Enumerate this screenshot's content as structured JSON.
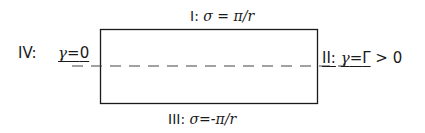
{
  "diagram": {
    "type": "boundary-conditions",
    "shape": "rectangle",
    "centerline": "dashed",
    "boundaries": {
      "top": {
        "id": "I",
        "prefix": "I:",
        "text": "σ = π/r"
      },
      "right": {
        "id": "II",
        "prefix": "II:",
        "var": "γ",
        "eq": "=",
        "val": "Γ",
        "rest": " > 0"
      },
      "bottom": {
        "id": "III",
        "prefix": "III:",
        "text": "σ=-π/r"
      },
      "left": {
        "id": "IV",
        "prefix": "IV:",
        "var": "γ",
        "eq": "=",
        "val": "0"
      }
    },
    "colors": {
      "line": "#1a1a1a",
      "dash": "#444444",
      "background": "#ffffff"
    }
  }
}
